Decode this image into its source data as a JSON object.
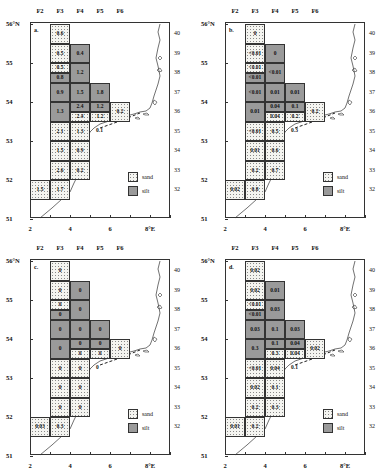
{
  "figure": {
    "columns": [
      "F2",
      "F3",
      "F4",
      "F5",
      "F6"
    ],
    "lat_labels": [
      "56°N",
      "55",
      "54",
      "53",
      "52",
      "51"
    ],
    "lon_labels": [
      "2",
      "4",
      "6",
      "8°E"
    ],
    "zone_labels": [
      "40",
      "39",
      "38",
      "37",
      "36",
      "35",
      "34",
      "33",
      "32"
    ],
    "legend": {
      "sand": "sand",
      "silt": "silt"
    },
    "colors": {
      "sand": "#f4f4f0",
      "silt": "#9a9a9a",
      "line": "#333333"
    }
  },
  "panels": [
    {
      "label": "a.",
      "cells": [
        {
          "c": 3,
          "r": 40,
          "h": "full",
          "type": "sand",
          "v": "0.6"
        },
        {
          "c": 3,
          "r": 39,
          "h": "full",
          "type": "sand",
          "v": "0.5"
        },
        {
          "c": 4,
          "r": 39,
          "h": "full",
          "type": "silt",
          "v": "0.4"
        },
        {
          "c": 3,
          "r": 38,
          "h": "top",
          "type": "sand",
          "v": "0.5"
        },
        {
          "c": 3,
          "r": 38,
          "h": "bottom",
          "type": "silt",
          "v": "0.8"
        },
        {
          "c": 4,
          "r": 38,
          "h": "full",
          "type": "silt",
          "v": "1.2"
        },
        {
          "c": 3,
          "r": 37,
          "h": "full",
          "type": "silt",
          "v": "0.9"
        },
        {
          "c": 4,
          "r": 37,
          "h": "full",
          "type": "silt",
          "v": "1.5"
        },
        {
          "c": 5,
          "r": 37,
          "h": "full",
          "type": "silt",
          "v": "1.8"
        },
        {
          "c": 3,
          "r": 36,
          "h": "full",
          "type": "silt",
          "v": "1.3"
        },
        {
          "c": 4,
          "r": 36,
          "h": "top",
          "type": "silt",
          "v": "2.4"
        },
        {
          "c": 4,
          "r": 36,
          "h": "bottom",
          "type": "sand",
          "v": "2.4"
        },
        {
          "c": 5,
          "r": 36,
          "h": "top",
          "type": "silt",
          "v": "1.2"
        },
        {
          "c": 5,
          "r": 36,
          "h": "bottom",
          "type": "sand",
          "v": "1.2"
        },
        {
          "c": 6,
          "r": 36,
          "h": "full",
          "type": "sand",
          "v": "0.2"
        },
        {
          "c": 3,
          "r": 35,
          "h": "full",
          "type": "sand",
          "v": "2.1"
        },
        {
          "c": 4,
          "r": 35,
          "h": "full",
          "type": "sand",
          "v": "1.3"
        },
        {
          "c": 3,
          "r": 34,
          "h": "full",
          "type": "sand",
          "v": "1.5"
        },
        {
          "c": 4,
          "r": 34,
          "h": "full",
          "type": "sand",
          "v": "0.9"
        },
        {
          "c": 3,
          "r": 33,
          "h": "full",
          "type": "sand",
          "v": "2.6"
        },
        {
          "c": 4,
          "r": 33,
          "h": "full",
          "type": "sand",
          "v": "0.2"
        },
        {
          "c": 2,
          "r": 32,
          "h": "full",
          "type": "sand",
          "v": "1.5"
        },
        {
          "c": 3,
          "r": 32,
          "h": "full",
          "type": "sand",
          "v": "1.7"
        }
      ],
      "free_values": [
        {
          "x": 5.3,
          "y": 53.25,
          "v": "0.1"
        }
      ]
    },
    {
      "label": "b.",
      "cells": [
        {
          "c": 3,
          "r": 40,
          "h": "full",
          "type": "sand",
          "v": "0"
        },
        {
          "c": 3,
          "r": 39,
          "h": "full",
          "type": "sand",
          "v": "<0.01"
        },
        {
          "c": 4,
          "r": 39,
          "h": "full",
          "type": "silt",
          "v": "0"
        },
        {
          "c": 3,
          "r": 38,
          "h": "top",
          "type": "sand",
          "v": "<0.01"
        },
        {
          "c": 3,
          "r": 38,
          "h": "bottom",
          "type": "silt",
          "v": "<0.01"
        },
        {
          "c": 4,
          "r": 38,
          "h": "full",
          "type": "silt",
          "v": "<0.01"
        },
        {
          "c": 3,
          "r": 37,
          "h": "full",
          "type": "silt",
          "v": "<0.01"
        },
        {
          "c": 4,
          "r": 37,
          "h": "full",
          "type": "silt",
          "v": "0.01"
        },
        {
          "c": 5,
          "r": 37,
          "h": "full",
          "type": "silt",
          "v": "0.01"
        },
        {
          "c": 3,
          "r": 36,
          "h": "full",
          "type": "silt",
          "v": "0.01"
        },
        {
          "c": 4,
          "r": 36,
          "h": "top",
          "type": "silt",
          "v": "0.04"
        },
        {
          "c": 4,
          "r": 36,
          "h": "bottom",
          "type": "sand",
          "v": "0.04"
        },
        {
          "c": 5,
          "r": 36,
          "h": "top",
          "type": "silt",
          "v": "0.1"
        },
        {
          "c": 5,
          "r": 36,
          "h": "bottom",
          "type": "sand",
          "v": "0.2"
        },
        {
          "c": 6,
          "r": 36,
          "h": "full",
          "type": "sand",
          "v": "0.2"
        },
        {
          "c": 3,
          "r": 35,
          "h": "full",
          "type": "sand",
          "v": "<0.01"
        },
        {
          "c": 4,
          "r": 35,
          "h": "full",
          "type": "sand",
          "v": "0.5"
        },
        {
          "c": 3,
          "r": 34,
          "h": "full",
          "type": "sand",
          "v": "0.01"
        },
        {
          "c": 4,
          "r": 34,
          "h": "full",
          "type": "sand",
          "v": "0.6"
        },
        {
          "c": 3,
          "r": 33,
          "h": "full",
          "type": "sand",
          "v": "0.2"
        },
        {
          "c": 4,
          "r": 33,
          "h": "full",
          "type": "sand",
          "v": "0.7"
        },
        {
          "c": 2,
          "r": 32,
          "h": "full",
          "type": "sand",
          "v": "0.02"
        },
        {
          "c": 3,
          "r": 32,
          "h": "full",
          "type": "sand",
          "v": "0.8"
        }
      ],
      "free_values": [
        {
          "x": 5.3,
          "y": 53.25,
          "v": "0.3"
        }
      ]
    },
    {
      "label": "c.",
      "cells": [
        {
          "c": 3,
          "r": 40,
          "h": "full",
          "type": "sand",
          "v": "0"
        },
        {
          "c": 3,
          "r": 39,
          "h": "full",
          "type": "sand",
          "v": "0"
        },
        {
          "c": 4,
          "r": 39,
          "h": "full",
          "type": "silt",
          "v": "0"
        },
        {
          "c": 3,
          "r": 38,
          "h": "top",
          "type": "sand",
          "v": "0"
        },
        {
          "c": 3,
          "r": 38,
          "h": "bottom",
          "type": "silt",
          "v": "0"
        },
        {
          "c": 4,
          "r": 38,
          "h": "full",
          "type": "silt",
          "v": "0"
        },
        {
          "c": 3,
          "r": 37,
          "h": "full",
          "type": "silt",
          "v": "0"
        },
        {
          "c": 4,
          "r": 37,
          "h": "full",
          "type": "silt",
          "v": "0"
        },
        {
          "c": 5,
          "r": 37,
          "h": "full",
          "type": "silt",
          "v": "0"
        },
        {
          "c": 3,
          "r": 36,
          "h": "full",
          "type": "silt",
          "v": "0"
        },
        {
          "c": 4,
          "r": 36,
          "h": "top",
          "type": "silt",
          "v": "0"
        },
        {
          "c": 4,
          "r": 36,
          "h": "bottom",
          "type": "sand",
          "v": "0"
        },
        {
          "c": 5,
          "r": 36,
          "h": "top",
          "type": "silt",
          "v": "0"
        },
        {
          "c": 5,
          "r": 36,
          "h": "bottom",
          "type": "sand",
          "v": "0"
        },
        {
          "c": 6,
          "r": 36,
          "h": "full",
          "type": "sand",
          "v": "0"
        },
        {
          "c": 3,
          "r": 35,
          "h": "full",
          "type": "sand",
          "v": "0"
        },
        {
          "c": 4,
          "r": 35,
          "h": "full",
          "type": "sand",
          "v": "0"
        },
        {
          "c": 3,
          "r": 34,
          "h": "full",
          "type": "sand",
          "v": "0"
        },
        {
          "c": 4,
          "r": 34,
          "h": "full",
          "type": "sand",
          "v": "0"
        },
        {
          "c": 3,
          "r": 33,
          "h": "full",
          "type": "sand",
          "v": "0"
        },
        {
          "c": 4,
          "r": 33,
          "h": "full",
          "type": "sand",
          "v": "0"
        },
        {
          "c": 2,
          "r": 32,
          "h": "full",
          "type": "sand",
          "v": "0.03"
        },
        {
          "c": 3,
          "r": 32,
          "h": "full",
          "type": "sand",
          "v": "0.3"
        }
      ],
      "free_values": [
        {
          "x": 5.3,
          "y": 53.25,
          "v": "0"
        }
      ]
    },
    {
      "label": "d.",
      "cells": [
        {
          "c": 3,
          "r": 40,
          "h": "full",
          "type": "sand",
          "v": "0.02"
        },
        {
          "c": 3,
          "r": 39,
          "h": "full",
          "type": "sand",
          "v": "0.02"
        },
        {
          "c": 4,
          "r": 39,
          "h": "full",
          "type": "silt",
          "v": "0.01"
        },
        {
          "c": 3,
          "r": 38,
          "h": "top",
          "type": "sand",
          "v": "<0.01"
        },
        {
          "c": 3,
          "r": 38,
          "h": "bottom",
          "type": "silt",
          "v": "<0.01"
        },
        {
          "c": 4,
          "r": 38,
          "h": "full",
          "type": "silt",
          "v": "0.03"
        },
        {
          "c": 3,
          "r": 37,
          "h": "full",
          "type": "silt",
          "v": "0.03"
        },
        {
          "c": 4,
          "r": 37,
          "h": "full",
          "type": "silt",
          "v": "0.1"
        },
        {
          "c": 5,
          "r": 37,
          "h": "full",
          "type": "silt",
          "v": "0.03"
        },
        {
          "c": 3,
          "r": 36,
          "h": "full",
          "type": "silt",
          "v": "0.3"
        },
        {
          "c": 4,
          "r": 36,
          "h": "top",
          "type": "silt",
          "v": "0.1"
        },
        {
          "c": 4,
          "r": 36,
          "h": "bottom",
          "type": "sand",
          "v": "0.3"
        },
        {
          "c": 5,
          "r": 36,
          "h": "top",
          "type": "silt",
          "v": "0.04"
        },
        {
          "c": 5,
          "r": 36,
          "h": "bottom",
          "type": "sand",
          "v": "0.04"
        },
        {
          "c": 6,
          "r": 36,
          "h": "full",
          "type": "sand",
          "v": "0.02"
        },
        {
          "c": 3,
          "r": 35,
          "h": "full",
          "type": "sand",
          "v": "<0.01"
        },
        {
          "c": 4,
          "r": 35,
          "h": "full",
          "type": "sand",
          "v": "0.04"
        },
        {
          "c": 3,
          "r": 34,
          "h": "full",
          "type": "sand",
          "v": "0.02"
        },
        {
          "c": 4,
          "r": 34,
          "h": "full",
          "type": "sand",
          "v": "0.1"
        },
        {
          "c": 3,
          "r": 33,
          "h": "full",
          "type": "sand",
          "v": "0.2"
        },
        {
          "c": 4,
          "r": 33,
          "h": "full",
          "type": "sand",
          "v": "0.3"
        },
        {
          "c": 2,
          "r": 32,
          "h": "full",
          "type": "sand",
          "v": "0.01"
        },
        {
          "c": 3,
          "r": 32,
          "h": "full",
          "type": "sand",
          "v": "0.2"
        }
      ],
      "free_values": [
        {
          "x": 5.3,
          "y": 53.25,
          "v": "0.1"
        }
      ]
    }
  ]
}
